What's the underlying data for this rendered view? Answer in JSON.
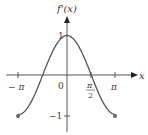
{
  "chart_data": {
    "type": "line",
    "title": "",
    "ylabel": "f'(x)",
    "xlabel": "x",
    "function": "cos(x)",
    "x": [
      -3.1416,
      -2.3562,
      -1.5708,
      -0.7854,
      0,
      0.7854,
      1.5708,
      2.3562,
      3.1416
    ],
    "series": [
      {
        "name": "f'(x)",
        "values": [
          -1,
          -0.707,
          0,
          0.707,
          1,
          0.707,
          0,
          -0.707,
          -1
        ]
      }
    ],
    "xtick_labels": [
      "-π",
      "0",
      "π/2",
      "π"
    ],
    "ytick_labels": [
      "1",
      "-1"
    ],
    "xlim": [
      -3.1416,
      3.1416
    ],
    "ylim": [
      -1,
      1
    ],
    "endpoints": [
      {
        "x": -3.1416,
        "y": -1,
        "marker": "filled-dot"
      },
      {
        "x": 3.1416,
        "y": -1,
        "marker": "filled-dot"
      }
    ],
    "grid": false
  },
  "labels": {
    "y_axis": "f'(x)",
    "x_axis": "x",
    "neg_pi": "− π",
    "zero": "0",
    "pi_half_num": "π",
    "pi_half_den": "2",
    "pi": "π",
    "one": "1",
    "neg_one": "−1"
  }
}
